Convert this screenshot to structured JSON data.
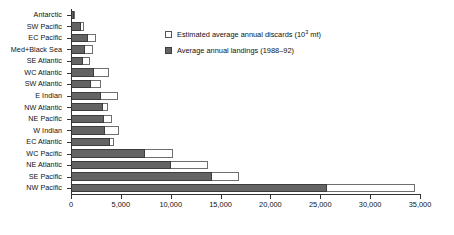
{
  "chart_data": {
    "type": "bar",
    "orientation": "horizontal",
    "stacked": true,
    "title": "",
    "xlabel": "",
    "ylabel": "",
    "xlim": [
      0,
      35000
    ],
    "xticks": [
      0,
      5000,
      10000,
      15000,
      20000,
      25000,
      30000,
      35000
    ],
    "xtick_labels": [
      "0",
      "5,000",
      "10,000",
      "15,000",
      "20,000",
      "25,000",
      "30,000",
      "35,000"
    ],
    "grid": false,
    "legend_position": "top-right",
    "units": "10^3 mt",
    "categories": [
      "Antarctic",
      "SW Pacific",
      "EC Pacific",
      "Med+Black Sea",
      "SE Atlantic",
      "WC Atlantic",
      "SW Atlantic",
      "E  Indian",
      "NW Atlantic",
      "NE Pacific",
      "W Indian",
      "EC Atlantic",
      "WC Pacific",
      "NE Atlantic",
      "SE Pacific",
      "NW Pacific"
    ],
    "series": [
      {
        "name": "Average annual landings (1988–92)",
        "color": "#646464",
        "values": [
          330,
          1000,
          1700,
          1400,
          1200,
          2300,
          2000,
          3000,
          3200,
          3300,
          3400,
          3900,
          7400,
          10000,
          14100,
          25700
        ]
      },
      {
        "name": "Estimated average annual discards (10³ mt)",
        "color": "#ffffff",
        "values": [
          20,
          350,
          800,
          800,
          700,
          1500,
          1000,
          1700,
          500,
          800,
          1400,
          400,
          2800,
          3700,
          2700,
          8800
        ]
      }
    ]
  },
  "legend": {
    "items": [
      {
        "swatch": "discards",
        "label_main": "Estimated average annual discards (10",
        "label_sup": "3",
        "label_tail": " mt)"
      },
      {
        "swatch": "landings",
        "label_main": "Average annual landings (1988–92)",
        "label_sup": "",
        "label_tail": ""
      }
    ]
  },
  "colors": {
    "landings": "#646464",
    "landings_border": "#3d3d3d",
    "discards": "#ffffff",
    "discards_border": "#6e6e6e",
    "axis": "#333333",
    "text": "#111111",
    "background": "#ffffff"
  }
}
